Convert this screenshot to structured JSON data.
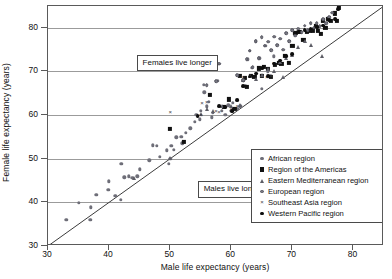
{
  "chart_data": {
    "type": "scatter",
    "title": "",
    "xlabel": "Male life expectancy (years)",
    "ylabel": "Female life expectancy (years)",
    "xlim": [
      30,
      85
    ],
    "ylim": [
      30,
      85
    ],
    "xticks": [
      30,
      40,
      50,
      60,
      70,
      80
    ],
    "yticks": [
      30,
      40,
      50,
      60,
      70,
      80
    ],
    "grid": "horizontal",
    "legend_position": "lower-right",
    "reference_line": {
      "type": "identity",
      "from": [
        30,
        30
      ],
      "to": [
        85,
        85
      ]
    },
    "annotations": [
      {
        "text": "Females live longer",
        "x": 44.5,
        "y": 72.5
      },
      {
        "text": "Males live longer",
        "x": 54.5,
        "y": 43.5
      }
    ],
    "series": [
      {
        "name": "African region",
        "marker": "dot",
        "color": "#6e6e78",
        "points": [
          [
            33.0,
            36.0
          ],
          [
            35.0,
            39.9
          ],
          [
            36.9,
            36.0
          ],
          [
            37.0,
            38.9
          ],
          [
            37.9,
            41.8
          ],
          [
            39.9,
            42.9
          ],
          [
            40.0,
            44.8
          ],
          [
            41.0,
            41.5
          ],
          [
            41.9,
            40.6
          ],
          [
            42.0,
            48.8
          ],
          [
            42.5,
            45.7
          ],
          [
            43.2,
            46.0
          ],
          [
            43.8,
            45.6
          ],
          [
            44.6,
            46.0
          ],
          [
            45.0,
            47.6
          ],
          [
            46.6,
            49.6
          ],
          [
            47.2,
            53.1
          ],
          [
            47.8,
            52.9
          ],
          [
            48.3,
            50.5
          ],
          [
            49.4,
            51.9
          ],
          [
            49.8,
            48.9
          ],
          [
            50.0,
            50.0
          ],
          [
            50.2,
            53.0
          ],
          [
            50.6,
            52.0
          ],
          [
            51.0,
            54.9
          ],
          [
            51.8,
            55.0
          ],
          [
            52.0,
            53.5
          ],
          [
            52.6,
            56.0
          ],
          [
            53.3,
            57.0
          ],
          [
            54.0,
            58.5
          ],
          [
            54.3,
            60.0
          ],
          [
            54.8,
            59.0
          ],
          [
            55.0,
            61.0
          ],
          [
            55.5,
            66.9
          ],
          [
            55.6,
            65.2
          ],
          [
            56.0,
            62.0
          ],
          [
            56.3,
            63.0
          ],
          [
            56.8,
            59.5
          ],
          [
            57.0,
            60.5
          ],
          [
            57.8,
            67.8
          ],
          [
            58.0,
            71.8
          ],
          [
            58.5,
            61.0
          ],
          [
            59.0,
            60.0
          ],
          [
            59.5,
            62.2
          ],
          [
            60.0,
            61.0
          ],
          [
            60.3,
            62.8
          ],
          [
            61.0,
            61.5
          ],
          [
            61.5,
            62.0
          ],
          [
            62.0,
            68.0
          ],
          [
            62.3,
            66.6
          ],
          [
            62.7,
            72.8
          ],
          [
            63.0,
            74.8
          ],
          [
            63.4,
            70.9
          ],
          [
            64.0,
            76.9
          ],
          [
            64.6,
            73.0
          ],
          [
            65.0,
            66.0
          ],
          [
            65.6,
            75.9
          ],
          [
            66.0,
            70.0
          ],
          [
            66.5,
            69.0
          ],
          [
            67.0,
            73.5
          ]
        ]
      },
      {
        "name": "Region of the Americas",
        "marker": "square",
        "color": "#111111",
        "points": [
          [
            50.0,
            56.8
          ],
          [
            52.2,
            53.8
          ],
          [
            56.5,
            64.7
          ],
          [
            58.8,
            61.9
          ],
          [
            59.6,
            63.6
          ],
          [
            60.5,
            61.5
          ],
          [
            61.4,
            68.9
          ],
          [
            62.2,
            68.5
          ],
          [
            62.5,
            66.5
          ],
          [
            63.2,
            69.0
          ],
          [
            63.8,
            68.8
          ],
          [
            64.5,
            70.7
          ],
          [
            65.0,
            69.0
          ],
          [
            65.4,
            71.0
          ],
          [
            66.0,
            70.5
          ],
          [
            66.5,
            68.8
          ],
          [
            67.2,
            71.5
          ],
          [
            67.8,
            72.0
          ],
          [
            68.2,
            71.8
          ],
          [
            68.8,
            73.6
          ],
          [
            69.4,
            72.0
          ],
          [
            70.0,
            75.9
          ],
          [
            70.5,
            78.8
          ],
          [
            71.2,
            79.0
          ],
          [
            71.8,
            77.2
          ],
          [
            72.4,
            79.0
          ],
          [
            72.9,
            79.2
          ],
          [
            73.4,
            79.4
          ],
          [
            73.9,
            80.4
          ],
          [
            74.2,
            79.2
          ],
          [
            74.7,
            78.6
          ],
          [
            75.0,
            81.5
          ],
          [
            75.4,
            80.0
          ],
          [
            75.8,
            82.0
          ],
          [
            76.3,
            81.6
          ],
          [
            76.9,
            83.3
          ],
          [
            77.3,
            81.5
          ],
          [
            77.6,
            84.5
          ]
        ]
      },
      {
        "name": "Eastern Mediterranean region",
        "marker": "triangle",
        "color": "#5d5d66",
        "points": [
          [
            44.0,
            45.6
          ],
          [
            50.0,
            50.2
          ],
          [
            55.0,
            60.2
          ],
          [
            56.0,
            61.5
          ],
          [
            57.0,
            61.0
          ],
          [
            58.5,
            62.0
          ],
          [
            60.0,
            62.0
          ],
          [
            61.5,
            62.2
          ],
          [
            62.0,
            68.0
          ],
          [
            63.0,
            69.0
          ],
          [
            64.0,
            68.2
          ],
          [
            65.0,
            69.3
          ],
          [
            66.0,
            70.5
          ],
          [
            67.0,
            70.0
          ],
          [
            68.0,
            72.2
          ],
          [
            69.0,
            73.0
          ],
          [
            70.0,
            73.8
          ],
          [
            71.0,
            75.6
          ],
          [
            72.0,
            77.0
          ],
          [
            73.0,
            76.0
          ],
          [
            74.8,
            73.5
          ],
          [
            68.5,
            68.8
          ]
        ]
      },
      {
        "name": "European region",
        "marker": "euro-dot",
        "color": "#7a7a84",
        "points": [
          [
            56.0,
            66.9
          ],
          [
            57.5,
            67.8
          ],
          [
            58.0,
            71.8
          ],
          [
            61.0,
            69.2
          ],
          [
            62.0,
            68.0
          ],
          [
            62.5,
            72.8
          ],
          [
            63.0,
            74.8
          ],
          [
            63.5,
            71.0
          ],
          [
            64.0,
            76.9
          ],
          [
            64.5,
            73.0
          ],
          [
            65.0,
            77.9
          ],
          [
            65.5,
            75.9
          ],
          [
            66.0,
            76.8
          ],
          [
            66.5,
            74.9
          ],
          [
            67.0,
            78.0
          ],
          [
            67.5,
            76.0
          ],
          [
            68.0,
            77.5
          ],
          [
            68.5,
            75.0
          ],
          [
            69.0,
            78.8
          ],
          [
            69.5,
            77.0
          ],
          [
            70.0,
            79.5
          ],
          [
            70.5,
            78.2
          ],
          [
            71.0,
            79.8
          ],
          [
            71.5,
            79.0
          ],
          [
            72.0,
            80.5
          ],
          [
            72.5,
            79.5
          ],
          [
            73.0,
            81.0
          ],
          [
            73.5,
            80.0
          ],
          [
            74.0,
            81.0
          ],
          [
            74.5,
            80.4
          ],
          [
            75.0,
            82.0
          ],
          [
            75.5,
            81.0
          ],
          [
            76.0,
            82.5
          ],
          [
            76.5,
            83.5
          ]
        ]
      },
      {
        "name": "Southeast Asia region",
        "marker": "x",
        "color": "#3a3a42",
        "points": [
          [
            50.0,
            60.6
          ],
          [
            55.0,
            60.0
          ],
          [
            55.2,
            62.8
          ],
          [
            56.0,
            63.0
          ],
          [
            57.5,
            61.0
          ],
          [
            58.0,
            60.8
          ],
          [
            60.0,
            61.5
          ],
          [
            61.0,
            62.0
          ],
          [
            62.0,
            68.8
          ],
          [
            65.8,
            68.8
          ],
          [
            66.5,
            69.0
          ],
          [
            67.0,
            72.0
          ]
        ]
      },
      {
        "name": "Western Pacific region",
        "marker": "circle",
        "color": "#0d0d0d",
        "points": [
          [
            54.5,
            59.8
          ],
          [
            58.0,
            62.0
          ],
          [
            59.0,
            61.8
          ],
          [
            60.2,
            61.0
          ],
          [
            61.0,
            63.5
          ],
          [
            62.0,
            66.6
          ],
          [
            63.0,
            68.8
          ],
          [
            64.0,
            69.5
          ],
          [
            65.0,
            70.8
          ],
          [
            66.0,
            69.0
          ],
          [
            67.0,
            71.8
          ],
          [
            68.0,
            72.5
          ],
          [
            69.0,
            73.5
          ],
          [
            70.0,
            74.0
          ],
          [
            71.0,
            79.0
          ],
          [
            72.0,
            79.5
          ],
          [
            73.0,
            79.8
          ],
          [
            74.0,
            80.2
          ],
          [
            75.0,
            80.5
          ],
          [
            76.0,
            81.8
          ],
          [
            77.0,
            82.0
          ],
          [
            77.5,
            84.2
          ]
        ]
      }
    ]
  },
  "legend": {
    "items": [
      {
        "label": "African region",
        "marker": "dot"
      },
      {
        "label": "Region of the Americas",
        "marker": "square"
      },
      {
        "label": "Eastern Mediterranean region",
        "marker": "triangle"
      },
      {
        "label": "European region",
        "marker": "euro-dot"
      },
      {
        "label": "Southeast Asia region",
        "marker": "x"
      },
      {
        "label": "Western Pacific region",
        "marker": "circle"
      }
    ]
  },
  "x_marker_glyph": "×"
}
